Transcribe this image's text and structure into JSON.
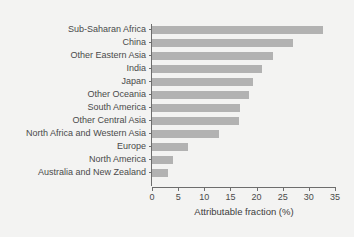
{
  "chart_data": {
    "type": "bar",
    "orientation": "horizontal",
    "title": "",
    "xlabel": "Attributable fraction (%)",
    "ylabel": "",
    "xlim": [
      0,
      35
    ],
    "xticks": [
      0,
      5,
      10,
      15,
      20,
      25,
      30,
      35
    ],
    "grid": false,
    "legend": null,
    "bar_color": "#b2b2b2",
    "background_color": "#f3f3f2",
    "axis_color": "#6d6d6d",
    "categories": [
      "Sub-Saharan Africa",
      "China",
      "Other Eastern Asia",
      "India",
      "Japan",
      "Other Oceania",
      "South America",
      "Other Central Asia",
      "North Africa and Western Asia",
      "Europe",
      "North America",
      "Australia and New Zealand"
    ],
    "values": [
      32.8,
      26.9,
      23.1,
      21.0,
      19.4,
      18.5,
      16.8,
      16.7,
      12.8,
      6.9,
      4.0,
      3.1
    ]
  }
}
